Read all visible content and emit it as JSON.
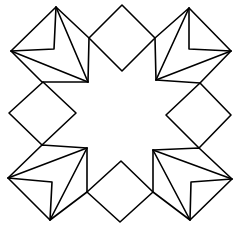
{
  "figure": {
    "stroke_color": "#000000",
    "background_color": "#ffffff",
    "shapes": {
      "diamonds": [
        {
          "name": "top",
          "points": "122,5 155,38 122,71 89,38"
        },
        {
          "name": "left",
          "points": "43,82 76,113 42,145 9,113"
        },
        {
          "name": "right",
          "points": "200,83 231,115 199,148 166,115"
        },
        {
          "name": "bottom",
          "points": "121,161 153,192 120,222 87,192"
        }
      ],
      "kites": [
        {
          "name": "top-left",
          "outline": "56,7 89,38 88,82 42,82 11,51",
          "inner_lines": [
            "56,7 54,49 11,51",
            "56,7 88,82",
            "11,51 88,82"
          ]
        },
        {
          "name": "top-right",
          "outline": "189,8 231,51 200,83 156,80 155,38",
          "inner_lines": [
            "189,8 189,49 231,51",
            "189,8 156,80",
            "231,51 156,80"
          ]
        },
        {
          "name": "bottom-left",
          "outline": "8,178 42,145 87,148 87,192 50,220",
          "inner_lines": [
            "8,178 52,182 50,220",
            "8,178 87,148",
            "50,220 87,148"
          ]
        },
        {
          "name": "bottom-right",
          "outline": "153,150 199,148 232,179 190,220 153,192",
          "inner_lines": [
            "232,179 191,182 190,220",
            "153,150 232,179",
            "153,150 190,220"
          ]
        }
      ]
    }
  }
}
